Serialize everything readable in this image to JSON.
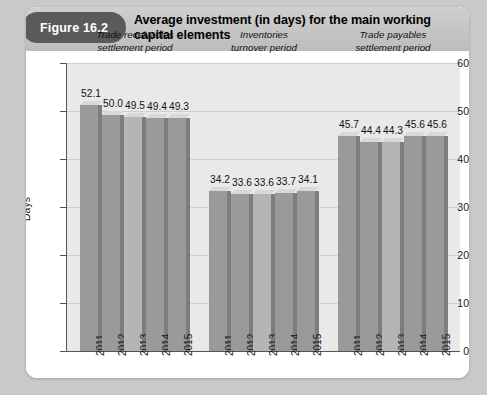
{
  "figure": {
    "badge": "Figure 16.2",
    "title": "Average investment (in days) for the main working capital elements"
  },
  "chart_data": {
    "type": "bar",
    "title": "Average investment (in days) for the main working capital elements",
    "xlabel": "",
    "ylabel": "Days",
    "ylim": [
      0,
      60
    ],
    "yticks": [
      0,
      10,
      20,
      30,
      40,
      50,
      60
    ],
    "grid": true,
    "legend": "none",
    "groups": [
      {
        "name": "Trade receivables settlement period",
        "label_line1": "Trade receivables",
        "label_line2": "settlement period",
        "categories": [
          "2011",
          "2012",
          "2013",
          "2014",
          "2015"
        ],
        "values": [
          52.1,
          50.0,
          49.5,
          49.4,
          49.3
        ],
        "labels": [
          "52.1",
          "50.0",
          "49.5",
          "49.4",
          "49.3"
        ]
      },
      {
        "name": "Inventories turnover period",
        "label_line1": "Inventories",
        "label_line2": "turnover period",
        "categories": [
          "2011",
          "2012",
          "2013",
          "2014",
          "2015"
        ],
        "values": [
          34.2,
          33.6,
          33.6,
          33.7,
          34.1
        ],
        "labels": [
          "34.2",
          "33.6",
          "33.6",
          "33.7",
          "34.1"
        ]
      },
      {
        "name": "Trade payables settlement period",
        "label_line1": "Trade payables",
        "label_line2": "settlement period",
        "categories": [
          "2011",
          "2012",
          "2013",
          "2014",
          "2015"
        ],
        "values": [
          45.7,
          44.4,
          44.3,
          45.6,
          45.6
        ],
        "labels": [
          "45.7",
          "44.4",
          "44.3",
          "45.6",
          "45.6"
        ]
      }
    ],
    "colors": {
      "bar_dark": "#9a9a9a",
      "bar_light": "#b5b5b5",
      "bar_side": "#7d7d7d",
      "bar_top": "#d8d8d8",
      "panel": "#e9e9e9",
      "gridline": "#cfcfcf",
      "axis": "#555555",
      "badge": "#5a5a5a",
      "header_band": "#c6c6c6",
      "card": "#ffffff",
      "page": "#c9c9c9"
    },
    "bar_shades": [
      [
        "dark",
        "dark",
        "light",
        "dark",
        "dark"
      ],
      [
        "dark",
        "dark",
        "light",
        "dark",
        "dark"
      ],
      [
        "dark",
        "dark",
        "light",
        "dark",
        "dark"
      ]
    ]
  }
}
